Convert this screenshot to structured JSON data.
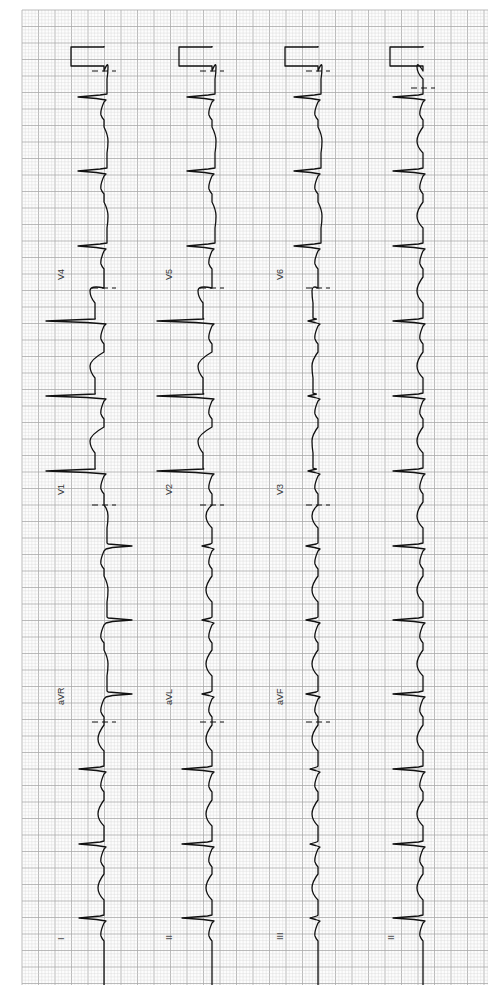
{
  "chart_data": {
    "type": "line",
    "orientation": "rotated-ccw",
    "paper": {
      "grid_color_minor": "#d6d6d6",
      "grid_color_major": "#a9a9a9",
      "trace_color": "#111111",
      "area": {
        "x0": 22,
        "y0": 10,
        "x1": 488,
        "y1": 985
      },
      "minor_px": 3.3,
      "major_px": 16.5
    },
    "calibration": {
      "height_mm": 10,
      "note": "standard 1 mV calibration pulse at start of each row"
    },
    "rows": [
      {
        "name": "row-1",
        "baseline_x": 104,
        "leads": [
          "I",
          "aVR",
          "V1",
          "V4"
        ]
      },
      {
        "name": "row-2",
        "baseline_x": 212,
        "leads": [
          "II",
          "aVL",
          "V2",
          "V5"
        ]
      },
      {
        "name": "row-3",
        "baseline_x": 318,
        "leads": [
          "III",
          "aVF",
          "V3",
          "V6"
        ]
      },
      {
        "name": "row-4",
        "baseline_x": 423,
        "leads": [
          "II"
        ],
        "rhythm_strip": true
      }
    ],
    "lead_labels": [
      {
        "text": "I",
        "x": 64,
        "y": 940
      },
      {
        "text": "aVR",
        "x": 64,
        "y": 705
      },
      {
        "text": "V1",
        "x": 64,
        "y": 495
      },
      {
        "text": "V4",
        "x": 64,
        "y": 280
      },
      {
        "text": "II",
        "x": 172,
        "y": 940
      },
      {
        "text": "aVL",
        "x": 172,
        "y": 705
      },
      {
        "text": "V2",
        "x": 172,
        "y": 495
      },
      {
        "text": "V5",
        "x": 172,
        "y": 280
      },
      {
        "text": "III",
        "x": 283,
        "y": 940
      },
      {
        "text": "aVF",
        "x": 283,
        "y": 705
      },
      {
        "text": "V3",
        "x": 283,
        "y": 495
      },
      {
        "text": "V6",
        "x": 283,
        "y": 280
      },
      {
        "text": "II",
        "x": 394,
        "y": 940
      }
    ],
    "lead_separators_y": [
      71,
      288,
      505,
      722
    ],
    "beats_y": [
      97,
      171,
      246,
      321,
      396,
      471,
      546,
      620,
      694,
      769,
      844,
      918
    ],
    "lead_segments": [
      {
        "row": 0,
        "lead": "V4",
        "y_from": 71,
        "y_to": 288,
        "qrs_deflection": -26,
        "st": "depressed"
      },
      {
        "row": 0,
        "lead": "V1",
        "y_from": 288,
        "y_to": 505,
        "qrs_deflection": -58,
        "st": "elevated-wide"
      },
      {
        "row": 0,
        "lead": "aVR",
        "y_from": 505,
        "y_to": 722,
        "qrs_deflection": 28,
        "st": "depressed"
      },
      {
        "row": 0,
        "lead": "I",
        "y_from": 722,
        "y_to": 985,
        "qrs_deflection": -25,
        "st": "normal"
      },
      {
        "row": 1,
        "lead": "V5",
        "y_from": 71,
        "y_to": 288,
        "qrs_deflection": -25,
        "st": "depressed"
      },
      {
        "row": 1,
        "lead": "V2",
        "y_from": 288,
        "y_to": 505,
        "qrs_deflection": -55,
        "st": "elevated-wide"
      },
      {
        "row": 1,
        "lead": "aVL",
        "y_from": 505,
        "y_to": 722,
        "qrs_deflection": -10,
        "st": "normal"
      },
      {
        "row": 1,
        "lead": "II",
        "y_from": 722,
        "y_to": 985,
        "qrs_deflection": -30,
        "st": "normal"
      },
      {
        "row": 2,
        "lead": "V6",
        "y_from": 71,
        "y_to": 288,
        "qrs_deflection": -24,
        "st": "depressed"
      },
      {
        "row": 2,
        "lead": "V3",
        "y_from": 288,
        "y_to": 505,
        "qrs_deflection": -10,
        "st": "elevated"
      },
      {
        "row": 2,
        "lead": "aVF",
        "y_from": 505,
        "y_to": 722,
        "qrs_deflection": -12,
        "st": "low-voltage"
      },
      {
        "row": 2,
        "lead": "III",
        "y_from": 722,
        "y_to": 985,
        "qrs_deflection": -8,
        "st": "low-voltage"
      },
      {
        "row": 3,
        "lead": "II",
        "y_from": 71,
        "y_to": 985,
        "qrs_deflection": -30,
        "st": "normal"
      }
    ],
    "xlabel": "",
    "ylabel": "",
    "grid": true,
    "legend": "none"
  }
}
